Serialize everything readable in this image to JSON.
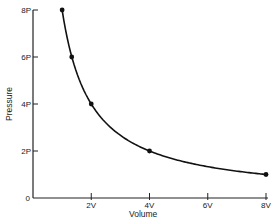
{
  "chart_data": {
    "type": "line",
    "title": "",
    "xlabel": "Volume",
    "ylabel": "Pressure",
    "x_ticks": [
      {
        "value": 0,
        "label": "0"
      },
      {
        "value": 2,
        "label": "2V"
      },
      {
        "value": 4,
        "label": "4V"
      },
      {
        "value": 6,
        "label": "6V"
      },
      {
        "value": 8,
        "label": "8V"
      }
    ],
    "y_ticks": [
      {
        "value": 2,
        "label": "2P"
      },
      {
        "value": 4,
        "label": "4P"
      },
      {
        "value": 6,
        "label": "6P"
      },
      {
        "value": 8,
        "label": "8P"
      }
    ],
    "xlim": [
      0,
      8
    ],
    "ylim": [
      0,
      8
    ],
    "grid": false,
    "legend": null,
    "series": [
      {
        "name": "Pressure vs Volume",
        "x": [
          1,
          1.33,
          2,
          4,
          8
        ],
        "y": [
          8,
          6,
          4,
          2,
          1
        ],
        "markers": true,
        "smooth_curve": true,
        "relation": "P*V = 8 (inverse proportion)"
      }
    ],
    "colors": {
      "line": "#111111",
      "axis": "#222222",
      "marker": "#111111"
    }
  }
}
